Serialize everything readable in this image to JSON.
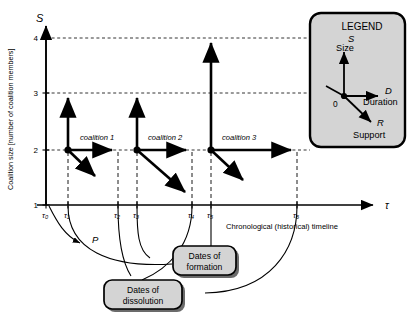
{
  "figure": {
    "background": "#ffffff",
    "ink": "#000000",
    "panel_fill": "#d4d4d4",
    "axes": {
      "y_axis_symbol": "S",
      "y_axis_title": "Coalition size [number of coalition members]",
      "y_ticks": [
        "1",
        "2",
        "3",
        "4"
      ],
      "x_axis_symbol": "τ",
      "x_ticks": [
        "τ₀",
        "τ₁",
        "τ₂",
        "τ₃",
        "τ₄",
        "τ₅",
        "τ₆"
      ],
      "x_axis_caption": "Chronological (historical) timeline"
    },
    "coalitions": [
      {
        "label": "coalition 1",
        "start_tick": "τ₁",
        "end_tick": "τ₂",
        "size": "2",
        "peak_size": "3"
      },
      {
        "label": "coalition 2",
        "start_tick": "τ₃",
        "end_tick": "τ₄",
        "size": "2",
        "peak_size": "3"
      },
      {
        "label": "coalition 3",
        "start_tick": "τ₅",
        "end_tick": "τ₆",
        "size": "2",
        "peak_size": "4"
      }
    ],
    "annotations": {
      "p_label": "P",
      "formation_callout": "Dates of\nformation",
      "formation_callout_line1": "Dates of",
      "formation_callout_line2": "formation",
      "dissolution_callout_line1": "Dates of",
      "dissolution_callout_line2": "dissolution"
    },
    "legend": {
      "title": "LEGEND",
      "origin_label": "0",
      "items": [
        {
          "symbol": "S",
          "name": "Size",
          "direction": "up"
        },
        {
          "symbol": "D",
          "name": "Duration",
          "direction": "right"
        },
        {
          "symbol": "R",
          "name": "Support",
          "direction": "down-right"
        }
      ]
    }
  }
}
